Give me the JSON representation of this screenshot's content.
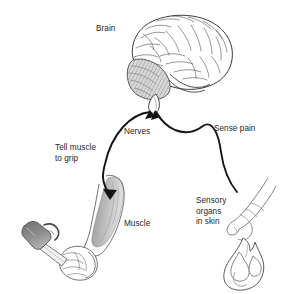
{
  "figure": {
    "background_color": "#ffffff",
    "ink_color": "#262626",
    "line_color": "#1a1a1a",
    "shading_color": "#a9a9a9"
  },
  "labels": {
    "brain": "Brain",
    "nerves": "Nerves",
    "sense_pain": "Sense pain",
    "tell_muscle_to_grip": "Tell muscle\nto grip",
    "muscle": "Muscle",
    "sensory_organs_in_skin": "Sensory\norgans\nin skin"
  },
  "illustrations": {
    "brain": "brain-illustration",
    "cerebellum": "cerebellum-shaded",
    "brain_stem": "brain-stem",
    "arm": "arm-with-muscle-illustration",
    "hammer": "hammer-illustration",
    "fist": "gripping-fist-illustration",
    "hand": "pointing-hand-illustration",
    "flame": "flame-illustration"
  },
  "arrows": {
    "motor_pathway": "arrow-brain-to-muscle",
    "sensory_pathway": "arrow-hand-to-brain"
  }
}
